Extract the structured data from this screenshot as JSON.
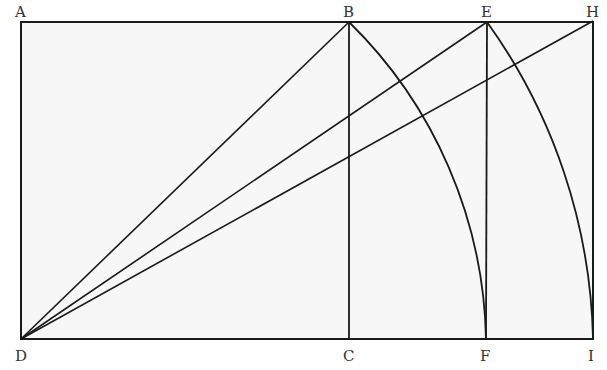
{
  "diagram": {
    "type": "geometric-construction",
    "points": {
      "A": {
        "label": "A",
        "x": 21,
        "y": 23
      },
      "B": {
        "label": "B",
        "x": 349,
        "y": 22
      },
      "E": {
        "label": "E",
        "x": 487,
        "y": 22
      },
      "H": {
        "label": "H",
        "x": 593,
        "y": 21
      },
      "D": {
        "label": "D",
        "x": 21,
        "y": 339
      },
      "C": {
        "label": "C",
        "x": 349,
        "y": 339
      },
      "F": {
        "label": "F",
        "x": 486,
        "y": 339
      },
      "I": {
        "label": "I",
        "x": 593,
        "y": 338
      }
    },
    "segments": [
      "AH",
      "DI",
      "AD",
      "BC",
      "EF",
      "HI",
      "DB",
      "DE",
      "DH"
    ],
    "arcs": [
      {
        "from": "B",
        "to": "F",
        "center": "D"
      },
      {
        "from": "E",
        "to": "I",
        "center": "D"
      }
    ],
    "colors": {
      "stroke": "#1a1a1a",
      "fill": "#f7f7f7",
      "background": "#ffffff"
    }
  }
}
